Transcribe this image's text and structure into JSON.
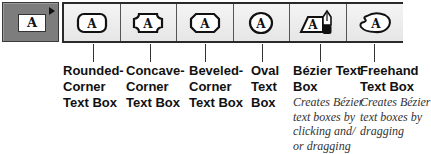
{
  "selected_tool": {
    "icon": "text-box-icon",
    "glyph": "A",
    "has_popout": true
  },
  "toolbar": {
    "tools": [
      {
        "id": "rounded-corner",
        "glyph": "A",
        "icon": "rounded-corner-text-box-icon",
        "label": "Rounded-\nCorner\nText Box",
        "description": ""
      },
      {
        "id": "concave-corner",
        "glyph": "A",
        "icon": "concave-corner-text-box-icon",
        "label": "Concave-\nCorner\nText Box",
        "description": ""
      },
      {
        "id": "beveled-corner",
        "glyph": "A",
        "icon": "beveled-corner-text-box-icon",
        "label": "Beveled-\nCorner\nText Box",
        "description": ""
      },
      {
        "id": "oval",
        "glyph": "A",
        "icon": "oval-text-box-icon",
        "label": "Oval\nText\nBox",
        "description": ""
      },
      {
        "id": "bezier",
        "glyph": "A",
        "icon": "bezier-text-box-icon",
        "label": "Bézier Text\nBox",
        "description": "Creates Bézier\ntext boxes by\nclicking and/\nor dragging"
      },
      {
        "id": "freehand",
        "glyph": "A",
        "icon": "freehand-text-box-icon",
        "label": "Freehand\nText Box",
        "description": "Creates Bézier\ntext boxes by\ndragging"
      }
    ]
  },
  "colors": {
    "selected_bg": "#7d7d7d",
    "toolbar_bg": "#eeeeee",
    "border": "#2a2a2a",
    "text": "#111111"
  }
}
